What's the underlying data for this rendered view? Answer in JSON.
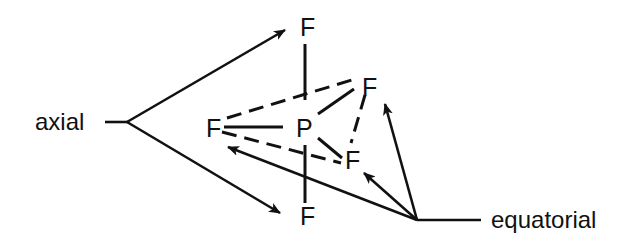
{
  "diagram": {
    "central_atom": "P",
    "atoms": {
      "axial_top": "F",
      "axial_bottom": "F",
      "equatorial_left": "F",
      "equatorial_back": "F",
      "equatorial_front": "F"
    },
    "labels": {
      "axial": "axial",
      "equatorial": "equatorial"
    },
    "colors": {
      "ink": "#111111",
      "background": "#ffffff"
    }
  }
}
